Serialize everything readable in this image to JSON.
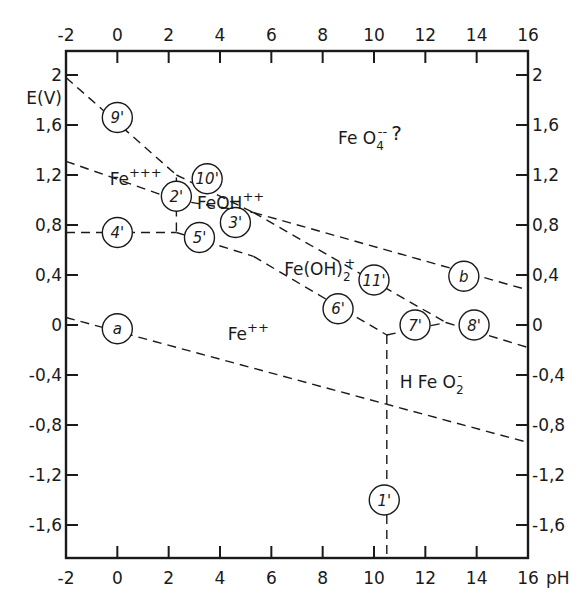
{
  "chart_data": {
    "type": "diagram",
    "xlabel": "pH",
    "ylabel": "E(V)",
    "xlim": [
      -2,
      16
    ],
    "ylim": [
      -1.86,
      2.2
    ],
    "x_ticks": [
      -2,
      0,
      2,
      4,
      6,
      8,
      10,
      12,
      14,
      16
    ],
    "x_tick_labels": [
      "-2",
      "0",
      "2",
      "4",
      "6",
      "8",
      "10",
      "12",
      "14",
      "16"
    ],
    "y_ticks": [
      2,
      1.6,
      1.2,
      0.8,
      0.4,
      0,
      -0.4,
      -0.8,
      -1.2,
      -1.6
    ],
    "y_tick_labels": [
      "2",
      "1,6",
      "1,2",
      "0,8",
      "0,4",
      "0",
      "-0,4",
      "-0,8",
      "-1,2",
      "-1,6"
    ],
    "lines": [
      {
        "id": "a",
        "points": [
          [
            -2,
            0.06
          ],
          [
            16,
            -0.94
          ]
        ]
      },
      {
        "id": "b",
        "points": [
          [
            5.3,
            0.9
          ],
          [
            16,
            0.28
          ]
        ]
      },
      {
        "id": "1'",
        "points": [
          [
            10.5,
            -0.08
          ],
          [
            10.5,
            -1.86
          ]
        ]
      },
      {
        "id": "2'",
        "points": [
          [
            2.3,
            1.18
          ],
          [
            2.3,
            0.74
          ]
        ]
      },
      {
        "id": "2'-upper",
        "points": [
          [
            -2,
            1.31
          ],
          [
            2.3,
            1.0
          ]
        ]
      },
      {
        "id": "3'",
        "points": [
          [
            2.3,
            1.0
          ],
          [
            5.3,
            0.9
          ]
        ]
      },
      {
        "id": "4'",
        "points": [
          [
            -2,
            0.74
          ],
          [
            2.3,
            0.74
          ]
        ]
      },
      {
        "id": "5'",
        "points": [
          [
            2.3,
            0.74
          ],
          [
            5.3,
            0.55
          ]
        ]
      },
      {
        "id": "6'",
        "points": [
          [
            5.3,
            0.55
          ],
          [
            10.5,
            -0.08
          ]
        ]
      },
      {
        "id": "7'",
        "points": [
          [
            10.5,
            -0.08
          ],
          [
            12.8,
            0.02
          ]
        ]
      },
      {
        "id": "8'",
        "points": [
          [
            12.8,
            0.02
          ],
          [
            16,
            -0.18
          ]
        ]
      },
      {
        "id": "9'",
        "points": [
          [
            -2,
            1.98
          ],
          [
            2.3,
            1.2
          ]
        ]
      },
      {
        "id": "10'",
        "points": [
          [
            2.3,
            1.2
          ],
          [
            5.3,
            0.9
          ]
        ]
      },
      {
        "id": "11'",
        "points": [
          [
            5.3,
            0.9
          ],
          [
            12.8,
            0.02
          ]
        ]
      }
    ],
    "line_markers": [
      {
        "label": "9'",
        "x": 0,
        "y": 1.66
      },
      {
        "label": "10'",
        "x": 3.5,
        "y": 1.17
      },
      {
        "label": "2'",
        "x": 2.3,
        "y": 1.03
      },
      {
        "label": "3'",
        "x": 4.6,
        "y": 0.82
      },
      {
        "label": "4'",
        "x": 0,
        "y": 0.74
      },
      {
        "label": "5'",
        "x": 3.2,
        "y": 0.7
      },
      {
        "label": "11'",
        "x": 10.0,
        "y": 0.36
      },
      {
        "label": "b",
        "x": 13.5,
        "y": 0.39
      },
      {
        "label": "6'",
        "x": 8.6,
        "y": 0.13
      },
      {
        "label": "7'",
        "x": 11.6,
        "y": 0.0
      },
      {
        "label": "8'",
        "x": 13.9,
        "y": 0.0
      },
      {
        "label": "a",
        "x": 0,
        "y": -0.03
      },
      {
        "label": "1'",
        "x": 10.4,
        "y": -1.4
      }
    ],
    "regions": [
      {
        "label": "FeO4--?",
        "x": 8.6,
        "y": 1.45
      },
      {
        "label": "Fe+++",
        "x": -0.3,
        "y": 1.12
      },
      {
        "label": "FeOH++",
        "x": 3.1,
        "y": 0.93
      },
      {
        "label": "Fe(OH)2+",
        "x": 6.5,
        "y": 0.4
      },
      {
        "label": "Fe++",
        "x": 4.3,
        "y": -0.12
      },
      {
        "label": "HFeO2-",
        "x": 11.0,
        "y": -0.5
      }
    ]
  },
  "axes": {
    "ylabel": "E(V)",
    "xlabel": "pH"
  },
  "regions": {
    "feo4": {
      "base": "Fe O",
      "sub": "4",
      "sup": "--",
      "suffix": "?"
    },
    "fe3": {
      "base": "Fe",
      "sup": "+++"
    },
    "feoh": {
      "base": "FeOH",
      "sup": "++"
    },
    "feoh2": {
      "base": "Fe(OH)",
      "sub": "2",
      "sup": "+"
    },
    "fe2": {
      "base": "Fe",
      "sup": "++"
    },
    "hfeo2": {
      "base": "H Fe O",
      "sub": "2",
      "sup": "-"
    }
  }
}
